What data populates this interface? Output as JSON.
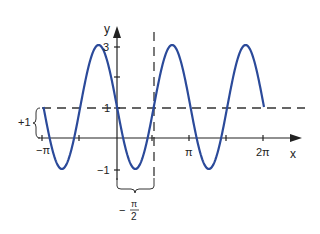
{
  "chart_data": {
    "type": "line",
    "title": "",
    "function": "y = 1 - 2 sin(2x)",
    "xlabel": "x",
    "ylabel": "y",
    "xlim": [
      -3.1416,
      6.2832
    ],
    "ylim": [
      -1,
      3
    ],
    "x_tick_labels": [
      "-π",
      "π",
      "2π"
    ],
    "y_tick_labels": [
      "3",
      "1",
      "-1"
    ],
    "annotations": {
      "vertical_shift_label": "+1",
      "phase_shift_label": "-π/2",
      "phase_shift_numerator": "π",
      "phase_shift_denominator": "2",
      "dashed_midline_y": 1,
      "dashed_vertical_x": 0.7854
    },
    "series": [
      {
        "name": "curve",
        "color": "#2b4a9a",
        "x": [
          -3.1416,
          -2.3562,
          -1.5708,
          -0.7854,
          0,
          0.7854,
          1.5708,
          2.3562,
          3.1416,
          3.927,
          4.7124,
          5.4978,
          6.2832
        ],
        "y": [
          1,
          3,
          1,
          3,
          1,
          -1,
          1,
          3,
          1,
          -1,
          1,
          3,
          1
        ]
      }
    ],
    "grid": false,
    "legend": false
  },
  "labels": {
    "y_axis": "y",
    "x_axis": "x",
    "y3": "3",
    "y1": "1",
    "ym1": "−1",
    "xmpi": "−π",
    "xpi": "π",
    "x2pi": "2π",
    "shift_up": "+1",
    "shift_minus": "−",
    "shift_num": "π",
    "shift_den": "2"
  }
}
